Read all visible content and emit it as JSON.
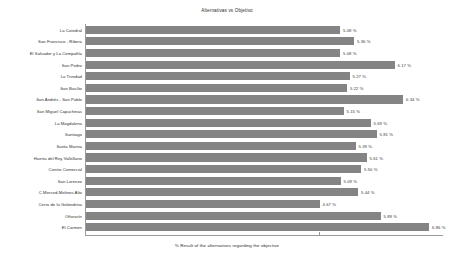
{
  "chart_data": {
    "type": "bar",
    "orientation": "horizontal",
    "title": "Alternativas vs Objetivo",
    "xlabel": "% Result of the alternatives regarding the objective",
    "ylabel": "",
    "xlim": [
      0,
      7.2
    ],
    "grid": false,
    "legend": null,
    "bar_color": "#848484",
    "value_suffix": " %",
    "categories": [
      "La Catedral",
      "San Francisco - Ribera",
      "El Salvador y La Compañía",
      "San Pedro",
      "La Trinidad",
      "San Basílio",
      "San Andrés - San Pablo",
      "San Miguel Capuchinas",
      "La Magdalena",
      "Santiago",
      "Santa Marina",
      "Huerta del Rey Vallellano",
      "Centro Comercial",
      "San Lorenzo",
      "C.Merced-Molinos Alto",
      "Cerro de la Golondrina",
      "Oñorarín",
      "El Carmen"
    ],
    "values": [
      5.08,
      5.36,
      5.08,
      6.17,
      5.27,
      5.22,
      6.34,
      5.15,
      5.69,
      5.81,
      5.39,
      5.61,
      5.5,
      5.09,
      5.44,
      4.67,
      5.89,
      6.86
    ],
    "value_labels": [
      "5.08 %",
      "5.36 %",
      "5.08 %",
      "6.17 %",
      "5.27 %",
      "5.22 %",
      "6.34 %",
      "5.15 %",
      "5.69 %",
      "5.81 %",
      "5.39 %",
      "5.61 %",
      "5.50 %",
      "5.09 %",
      "5.44 %",
      "4.67 %",
      "5.89 %",
      "6.86 %"
    ]
  }
}
